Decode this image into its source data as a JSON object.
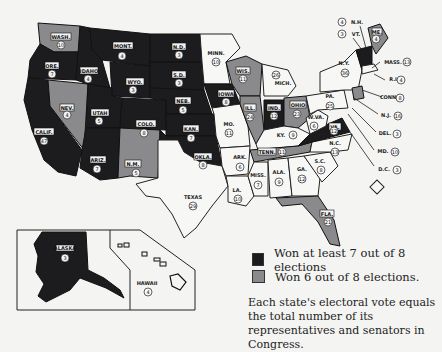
{
  "legend": {
    "items": [
      {
        "label": "Won at least 7 out of 8 elections",
        "color": "#1c1c1e"
      },
      {
        "label": "Won 6 out of 8 elections.",
        "color": "#8a8a8c"
      }
    ]
  },
  "note": "Each state's electoral vote equals the total number of its representatives and senators in Congress.",
  "states": [
    {
      "abbr": "WASH.",
      "votes": "10",
      "category": "gray"
    },
    {
      "abbr": "ORE.",
      "votes": "7",
      "category": "dark"
    },
    {
      "abbr": "CALIF.",
      "votes": "47",
      "category": "dark"
    },
    {
      "abbr": "NEV.",
      "votes": "4",
      "category": "gray"
    },
    {
      "abbr": "IDAHO",
      "votes": "4",
      "category": "dark"
    },
    {
      "abbr": "MONT.",
      "votes": "4",
      "category": "dark"
    },
    {
      "abbr": "WYO.",
      "votes": "3",
      "category": "dark"
    },
    {
      "abbr": "UTAH",
      "votes": "5",
      "category": "dark"
    },
    {
      "abbr": "ARIZ.",
      "votes": "7",
      "category": "dark"
    },
    {
      "abbr": "COLO.",
      "votes": "8",
      "category": "dark"
    },
    {
      "abbr": "N.M.",
      "votes": "5",
      "category": "gray"
    },
    {
      "abbr": "N.D.",
      "votes": "3",
      "category": "dark"
    },
    {
      "abbr": "S.D.",
      "votes": "3",
      "category": "dark"
    },
    {
      "abbr": "NEB.",
      "votes": "5",
      "category": "dark"
    },
    {
      "abbr": "KAN.",
      "votes": "7",
      "category": "dark"
    },
    {
      "abbr": "OKLA.",
      "votes": "8",
      "category": "dark"
    },
    {
      "abbr": "TEXAS",
      "votes": "29",
      "category": "white"
    },
    {
      "abbr": "MINN.",
      "votes": "10",
      "category": "white"
    },
    {
      "abbr": "IOWA",
      "votes": "8",
      "category": "dark"
    },
    {
      "abbr": "MO.",
      "votes": "11",
      "category": "white"
    },
    {
      "abbr": "ARK.",
      "votes": "6",
      "category": "white"
    },
    {
      "abbr": "LA.",
      "votes": "10",
      "category": "white"
    },
    {
      "abbr": "WIS.",
      "votes": "11",
      "category": "gray"
    },
    {
      "abbr": "ILL.",
      "votes": "24",
      "category": "gray"
    },
    {
      "abbr": "MICH.",
      "votes": "26",
      "category": "white"
    },
    {
      "abbr": "IND.",
      "votes": "12",
      "category": "dark"
    },
    {
      "abbr": "OHIO",
      "votes": "23",
      "category": "gray"
    },
    {
      "abbr": "KY.",
      "votes": "9",
      "category": "white"
    },
    {
      "abbr": "TENN.",
      "votes": "11",
      "category": "gray"
    },
    {
      "abbr": "MISS.",
      "votes": "7",
      "category": "white"
    },
    {
      "abbr": "ALA.",
      "votes": "9",
      "category": "white"
    },
    {
      "abbr": "GA.",
      "votes": "12",
      "category": "white"
    },
    {
      "abbr": "FLA.",
      "votes": "21",
      "category": "gray"
    },
    {
      "abbr": "S.C.",
      "votes": "8",
      "category": "white"
    },
    {
      "abbr": "N.C.",
      "votes": "13",
      "category": "white"
    },
    {
      "abbr": "VA.",
      "votes": "12",
      "category": "dark"
    },
    {
      "abbr": "W.VA.",
      "votes": "6",
      "category": "white"
    },
    {
      "abbr": "PA.",
      "votes": "25",
      "category": "white"
    },
    {
      "abbr": "N.Y.",
      "votes": "36",
      "category": "white"
    },
    {
      "abbr": "VT.",
      "votes": "3",
      "category": "dark"
    },
    {
      "abbr": "N.H.",
      "votes": "4",
      "category": "dark"
    },
    {
      "abbr": "ME.",
      "votes": "4",
      "category": "gray"
    },
    {
      "abbr": "MASS.",
      "votes": "13",
      "category": "white"
    },
    {
      "abbr": "R.I.",
      "votes": "4",
      "category": "white"
    },
    {
      "abbr": "CONN.",
      "votes": "8",
      "category": "gray"
    },
    {
      "abbr": "N.J.",
      "votes": "16",
      "category": "white"
    },
    {
      "abbr": "DEL.",
      "votes": "3",
      "category": "white"
    },
    {
      "abbr": "MD.",
      "votes": "10",
      "category": "white"
    },
    {
      "abbr": "D.C.",
      "votes": "3",
      "category": "white"
    },
    {
      "abbr": "ALASKA",
      "votes": "3",
      "category": "dark"
    },
    {
      "abbr": "HAWAII",
      "votes": "4",
      "category": "white"
    }
  ]
}
